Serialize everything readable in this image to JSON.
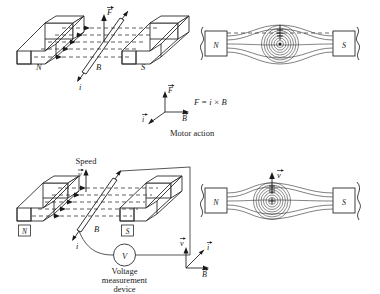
{
  "figure": {
    "panels": [
      {
        "id": "motor-perspective",
        "kind": "3d-perspective",
        "labels": {
          "north_pole": "N",
          "south_pole": "S",
          "field": "B",
          "current": "i",
          "force": "F"
        }
      },
      {
        "id": "motor-cross-section",
        "kind": "cross-section",
        "labels": {
          "north_pole": "N",
          "south_pole": "S",
          "conductor_marker": "dot-out-of-page"
        }
      },
      {
        "id": "generator-perspective",
        "kind": "3d-perspective",
        "labels": {
          "north_pole": "N",
          "south_pole": "S",
          "field": "B",
          "current": "i",
          "speed_caption": "Speed",
          "velocity": "v",
          "meter_symbol": "V",
          "meter_caption_line1": "Voltage",
          "meter_caption_line2": "measurement",
          "meter_caption_line3": "device"
        }
      },
      {
        "id": "generator-cross-section",
        "kind": "cross-section",
        "labels": {
          "north_pole": "N",
          "south_pole": "S",
          "velocity": "v",
          "conductor_marker": "plus-into-page"
        }
      }
    ],
    "legends": [
      {
        "id": "motor-legend",
        "axis_up": "F",
        "axis_right": "B",
        "axis_diag": "i",
        "equation": "F = i × B",
        "caption": "Motor action"
      },
      {
        "id": "generator-legend",
        "axis_up": "v",
        "axis_right": "B",
        "axis_diag": "i",
        "equation": "",
        "caption": ""
      }
    ],
    "colors": {
      "ink": "#1a1a1a",
      "line": "#2b2b2b",
      "field_line": "#4a4a4a",
      "background": "#ffffff"
    }
  }
}
